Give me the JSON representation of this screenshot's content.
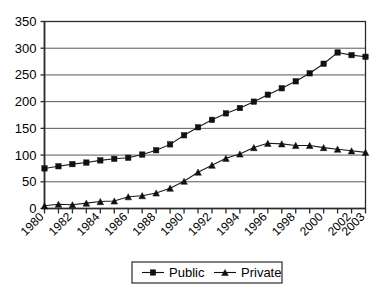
{
  "chart_data": {
    "type": "line",
    "title": "",
    "subtitle": "",
    "xlabel": "",
    "ylabel": "",
    "x": [
      1980,
      1981,
      1982,
      1983,
      1984,
      1985,
      1986,
      1987,
      1988,
      1989,
      1990,
      1991,
      1992,
      1993,
      1994,
      1995,
      1996,
      1997,
      1998,
      1999,
      2000,
      2001,
      2002,
      2003
    ],
    "xtick_labels": [
      "1980",
      "1982",
      "1984",
      "1986",
      "1988",
      "1990",
      "1992",
      "1994",
      "1996",
      "1998",
      "2000",
      "2002",
      "2003"
    ],
    "xtick_values": [
      1980,
      1982,
      1984,
      1986,
      1988,
      1990,
      1992,
      1994,
      1996,
      1998,
      2000,
      2002,
      2003
    ],
    "ytick_labels": [
      "0",
      "50",
      "100",
      "150",
      "200",
      "250",
      "300",
      "350"
    ],
    "ytick_values": [
      0,
      50,
      100,
      150,
      200,
      250,
      300,
      350
    ],
    "ylim": [
      0,
      350
    ],
    "xlim": [
      1980,
      2003
    ],
    "grid": true,
    "grid_axis": "y",
    "legend_position": "bottom-center",
    "series": [
      {
        "name": "Public",
        "marker": "square",
        "color": "#111111",
        "values": [
          75,
          79,
          83,
          86,
          90,
          93,
          95,
          101,
          109,
          120,
          137,
          152,
          166,
          178,
          188,
          200,
          213,
          225,
          238,
          253,
          271,
          292,
          287,
          284
        ]
      },
      {
        "name": "Private",
        "marker": "triangle",
        "color": "#111111",
        "values": [
          5,
          8,
          7,
          10,
          13,
          14,
          22,
          24,
          29,
          38,
          51,
          68,
          81,
          94,
          102,
          114,
          122,
          121,
          118,
          118,
          114,
          111,
          108,
          105
        ]
      }
    ]
  },
  "legend": {
    "items": [
      {
        "label": "Public",
        "marker": "square"
      },
      {
        "label": "Private",
        "marker": "triangle"
      }
    ]
  },
  "colors": {
    "plot_background": "#ffffff",
    "gridline": "#595959",
    "axis": "#2b2b2b",
    "series_public": "#111111",
    "series_private": "#111111"
  }
}
